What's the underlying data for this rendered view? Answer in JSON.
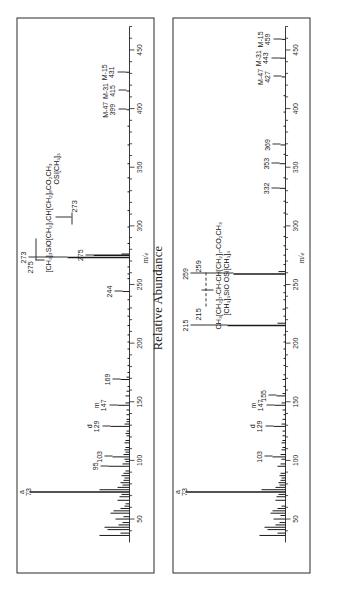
{
  "figure": {
    "y_axis_label": "Relative Abundance",
    "x_axis_label": "m/e"
  },
  "chart_data": [
    {
      "type": "bar",
      "name": "spectrum-top",
      "title": "",
      "xlabel": "m/e",
      "ylabel": "Relative Abundance",
      "xlim": [
        30,
        470
      ],
      "ylim": [
        0,
        100
      ],
      "ticks": [
        50,
        100,
        150,
        200,
        250,
        300,
        350,
        400,
        450
      ],
      "grid": false,
      "structure": {
        "line1": "[CH₃]₃SiO[CH₂]₇CH[CH₂]₈CO₂CH₃",
        "line2": "OSi[CH₃]₃",
        "fragment_left": "275",
        "fragment_right": "273"
      },
      "labels": [
        {
          "text": "a",
          "mz": 73,
          "kind": "letter"
        },
        {
          "text": "73",
          "mz": 73,
          "kind": "mass"
        },
        {
          "text": "95",
          "mz": 95,
          "kind": "mass"
        },
        {
          "text": "103",
          "mz": 103,
          "kind": "mass"
        },
        {
          "text": "d",
          "mz": 129,
          "kind": "letter"
        },
        {
          "text": "129",
          "mz": 129,
          "kind": "mass"
        },
        {
          "text": "m",
          "mz": 147,
          "kind": "letter"
        },
        {
          "text": "147",
          "mz": 147,
          "kind": "mass"
        },
        {
          "text": "169",
          "mz": 169,
          "kind": "mass"
        },
        {
          "text": "244",
          "mz": 244,
          "kind": "mass"
        },
        {
          "text": "275",
          "mz": 275,
          "kind": "mass"
        },
        {
          "text": "273",
          "mz": 273,
          "kind": "mass"
        },
        {
          "text": "M-47",
          "mz": 399,
          "kind": "loss"
        },
        {
          "text": "399",
          "mz": 399,
          "kind": "mass"
        },
        {
          "text": "M-31",
          "mz": 415,
          "kind": "loss"
        },
        {
          "text": "415",
          "mz": 415,
          "kind": "mass"
        },
        {
          "text": "M-15",
          "mz": 431,
          "kind": "loss"
        },
        {
          "text": "431",
          "mz": 431,
          "kind": "mass"
        }
      ],
      "peaks": [
        {
          "mz": 36,
          "i": 30
        },
        {
          "mz": 38,
          "i": 9
        },
        {
          "mz": 41,
          "i": 22
        },
        {
          "mz": 43,
          "i": 25
        },
        {
          "mz": 45,
          "i": 11
        },
        {
          "mz": 47,
          "i": 7
        },
        {
          "mz": 50,
          "i": 14
        },
        {
          "mz": 52,
          "i": 6
        },
        {
          "mz": 55,
          "i": 19
        },
        {
          "mz": 57,
          "i": 16
        },
        {
          "mz": 59,
          "i": 9
        },
        {
          "mz": 61,
          "i": 5
        },
        {
          "mz": 63,
          "i": 4
        },
        {
          "mz": 66,
          "i": 12
        },
        {
          "mz": 69,
          "i": 10
        },
        {
          "mz": 71,
          "i": 8
        },
        {
          "mz": 73,
          "i": 100
        },
        {
          "mz": 75,
          "i": 30
        },
        {
          "mz": 77,
          "i": 12
        },
        {
          "mz": 79,
          "i": 7
        },
        {
          "mz": 81,
          "i": 9
        },
        {
          "mz": 83,
          "i": 6
        },
        {
          "mz": 85,
          "i": 5
        },
        {
          "mz": 87,
          "i": 8
        },
        {
          "mz": 89,
          "i": 6
        },
        {
          "mz": 91,
          "i": 4
        },
        {
          "mz": 95,
          "i": 21
        },
        {
          "mz": 97,
          "i": 7
        },
        {
          "mz": 99,
          "i": 4
        },
        {
          "mz": 101,
          "i": 5
        },
        {
          "mz": 103,
          "i": 17
        },
        {
          "mz": 105,
          "i": 6
        },
        {
          "mz": 107,
          "i": 4
        },
        {
          "mz": 109,
          "i": 5
        },
        {
          "mz": 111,
          "i": 4
        },
        {
          "mz": 115,
          "i": 5
        },
        {
          "mz": 117,
          "i": 4
        },
        {
          "mz": 121,
          "i": 3
        },
        {
          "mz": 123,
          "i": 4
        },
        {
          "mz": 125,
          "i": 3
        },
        {
          "mz": 129,
          "i": 19
        },
        {
          "mz": 131,
          "i": 5
        },
        {
          "mz": 133,
          "i": 3
        },
        {
          "mz": 135,
          "i": 3
        },
        {
          "mz": 139,
          "i": 3
        },
        {
          "mz": 143,
          "i": 3
        },
        {
          "mz": 147,
          "i": 12
        },
        {
          "mz": 149,
          "i": 4
        },
        {
          "mz": 155,
          "i": 4
        },
        {
          "mz": 159,
          "i": 3
        },
        {
          "mz": 163,
          "i": 2
        },
        {
          "mz": 169,
          "i": 9
        },
        {
          "mz": 171,
          "i": 3
        },
        {
          "mz": 175,
          "i": 2
        },
        {
          "mz": 181,
          "i": 2
        },
        {
          "mz": 187,
          "i": 2
        },
        {
          "mz": 195,
          "i": 2
        },
        {
          "mz": 201,
          "i": 2
        },
        {
          "mz": 207,
          "i": 2
        },
        {
          "mz": 215,
          "i": 2
        },
        {
          "mz": 223,
          "i": 2
        },
        {
          "mz": 229,
          "i": 2
        },
        {
          "mz": 237,
          "i": 2
        },
        {
          "mz": 244,
          "i": 7
        },
        {
          "mz": 255,
          "i": 2
        },
        {
          "mz": 259,
          "i": 2
        },
        {
          "mz": 265,
          "i": 2
        },
        {
          "mz": 273,
          "i": 62
        },
        {
          "mz": 275,
          "i": 36
        },
        {
          "mz": 276,
          "i": 8
        },
        {
          "mz": 285,
          "i": 2
        },
        {
          "mz": 299,
          "i": 2
        },
        {
          "mz": 313,
          "i": 2
        },
        {
          "mz": 329,
          "i": 2
        },
        {
          "mz": 341,
          "i": 2
        },
        {
          "mz": 353,
          "i": 2
        },
        {
          "mz": 369,
          "i": 2
        },
        {
          "mz": 385,
          "i": 2
        },
        {
          "mz": 399,
          "i": 3
        },
        {
          "mz": 415,
          "i": 3
        },
        {
          "mz": 431,
          "i": 4
        }
      ]
    },
    {
      "type": "bar",
      "name": "spectrum-bottom",
      "title": "",
      "xlabel": "m/e",
      "ylabel": "Relative Abundance",
      "xlim": [
        30,
        470
      ],
      "ylim": [
        0,
        100
      ],
      "ticks": [
        50,
        100,
        150,
        200,
        250,
        300,
        350,
        400,
        450
      ],
      "grid": false,
      "structure": {
        "line1": "CH₃[CH₂]₇-CH-CH[CH₂]₇-CO₂CH₃",
        "line2": "[CH₃]₃SiO   OSi[CH₃]₃",
        "fragment_left": "215",
        "fragment_right": "259"
      },
      "labels": [
        {
          "text": "a",
          "mz": 73,
          "kind": "letter"
        },
        {
          "text": "73",
          "mz": 73,
          "kind": "mass"
        },
        {
          "text": "103",
          "mz": 103,
          "kind": "mass"
        },
        {
          "text": "d",
          "mz": 129,
          "kind": "letter"
        },
        {
          "text": "129",
          "mz": 129,
          "kind": "mass"
        },
        {
          "text": "m",
          "mz": 147,
          "kind": "letter"
        },
        {
          "text": "147",
          "mz": 147,
          "kind": "mass"
        },
        {
          "text": "155",
          "mz": 155,
          "kind": "mass"
        },
        {
          "text": "215",
          "mz": 215,
          "kind": "mass"
        },
        {
          "text": "259",
          "mz": 259,
          "kind": "mass"
        },
        {
          "text": "332",
          "mz": 332,
          "kind": "mass"
        },
        {
          "text": "353",
          "mz": 353,
          "kind": "mass"
        },
        {
          "text": "369",
          "mz": 369,
          "kind": "mass"
        },
        {
          "text": "M-47",
          "mz": 427,
          "kind": "loss"
        },
        {
          "text": "427",
          "mz": 427,
          "kind": "mass"
        },
        {
          "text": "M-31",
          "mz": 443,
          "kind": "loss"
        },
        {
          "text": "443",
          "mz": 443,
          "kind": "mass"
        },
        {
          "text": "M-15",
          "mz": 459,
          "kind": "loss"
        },
        {
          "text": "459",
          "mz": 459,
          "kind": "mass"
        }
      ],
      "peaks": [
        {
          "mz": 36,
          "i": 26
        },
        {
          "mz": 38,
          "i": 8
        },
        {
          "mz": 41,
          "i": 18
        },
        {
          "mz": 43,
          "i": 21
        },
        {
          "mz": 45,
          "i": 10
        },
        {
          "mz": 47,
          "i": 6
        },
        {
          "mz": 50,
          "i": 12
        },
        {
          "mz": 53,
          "i": 5
        },
        {
          "mz": 55,
          "i": 15
        },
        {
          "mz": 57,
          "i": 13
        },
        {
          "mz": 59,
          "i": 8
        },
        {
          "mz": 61,
          "i": 4
        },
        {
          "mz": 66,
          "i": 10
        },
        {
          "mz": 69,
          "i": 9
        },
        {
          "mz": 71,
          "i": 7
        },
        {
          "mz": 73,
          "i": 100
        },
        {
          "mz": 75,
          "i": 24
        },
        {
          "mz": 77,
          "i": 10
        },
        {
          "mz": 79,
          "i": 6
        },
        {
          "mz": 81,
          "i": 7
        },
        {
          "mz": 83,
          "i": 5
        },
        {
          "mz": 85,
          "i": 4
        },
        {
          "mz": 87,
          "i": 6
        },
        {
          "mz": 89,
          "i": 5
        },
        {
          "mz": 95,
          "i": 8
        },
        {
          "mz": 97,
          "i": 5
        },
        {
          "mz": 101,
          "i": 4
        },
        {
          "mz": 103,
          "i": 13
        },
        {
          "mz": 105,
          "i": 5
        },
        {
          "mz": 109,
          "i": 4
        },
        {
          "mz": 111,
          "i": 3
        },
        {
          "mz": 115,
          "i": 4
        },
        {
          "mz": 117,
          "i": 3
        },
        {
          "mz": 121,
          "i": 3
        },
        {
          "mz": 125,
          "i": 3
        },
        {
          "mz": 129,
          "i": 12
        },
        {
          "mz": 131,
          "i": 4
        },
        {
          "mz": 135,
          "i": 3
        },
        {
          "mz": 139,
          "i": 2
        },
        {
          "mz": 143,
          "i": 3
        },
        {
          "mz": 147,
          "i": 11
        },
        {
          "mz": 149,
          "i": 4
        },
        {
          "mz": 155,
          "i": 9
        },
        {
          "mz": 157,
          "i": 3
        },
        {
          "mz": 163,
          "i": 2
        },
        {
          "mz": 169,
          "i": 3
        },
        {
          "mz": 173,
          "i": 2
        },
        {
          "mz": 181,
          "i": 2
        },
        {
          "mz": 187,
          "i": 2
        },
        {
          "mz": 195,
          "i": 2
        },
        {
          "mz": 201,
          "i": 2
        },
        {
          "mz": 207,
          "i": 2
        },
        {
          "mz": 215,
          "i": 58
        },
        {
          "mz": 217,
          "i": 8
        },
        {
          "mz": 223,
          "i": 2
        },
        {
          "mz": 229,
          "i": 3
        },
        {
          "mz": 237,
          "i": 2
        },
        {
          "mz": 243,
          "i": 2
        },
        {
          "mz": 249,
          "i": 2
        },
        {
          "mz": 259,
          "i": 52
        },
        {
          "mz": 261,
          "i": 7
        },
        {
          "mz": 267,
          "i": 2
        },
        {
          "mz": 275,
          "i": 2
        },
        {
          "mz": 283,
          "i": 2
        },
        {
          "mz": 291,
          "i": 2
        },
        {
          "mz": 299,
          "i": 2
        },
        {
          "mz": 311,
          "i": 2
        },
        {
          "mz": 321,
          "i": 2
        },
        {
          "mz": 332,
          "i": 6
        },
        {
          "mz": 341,
          "i": 2
        },
        {
          "mz": 353,
          "i": 6
        },
        {
          "mz": 361,
          "i": 2
        },
        {
          "mz": 369,
          "i": 5
        },
        {
          "mz": 385,
          "i": 2
        },
        {
          "mz": 397,
          "i": 2
        },
        {
          "mz": 411,
          "i": 2
        },
        {
          "mz": 427,
          "i": 4
        },
        {
          "mz": 443,
          "i": 6
        },
        {
          "mz": 459,
          "i": 4
        }
      ]
    }
  ]
}
